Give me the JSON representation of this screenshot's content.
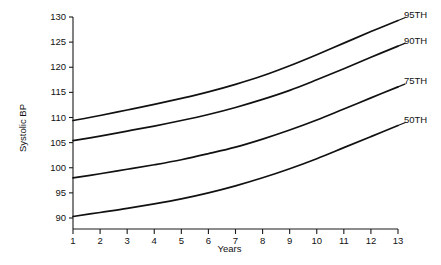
{
  "chart_data": {
    "type": "line",
    "title": "",
    "xlabel": "Years",
    "ylabel": "Systolic BP",
    "xlim": [
      1,
      13
    ],
    "ylim": [
      88,
      130
    ],
    "grid": false,
    "legend_position": "right-of-line-ends",
    "xticks": [
      1,
      2,
      3,
      4,
      5,
      6,
      7,
      8,
      9,
      10,
      11,
      12,
      13
    ],
    "xtick_labels": [
      "1",
      "2",
      "3",
      "4",
      "5",
      "6",
      "7",
      "8",
      "9",
      "10",
      "11",
      "12",
      "13"
    ],
    "yticks": [
      90,
      95,
      100,
      105,
      110,
      115,
      120,
      125,
      130
    ],
    "ytick_labels": [
      "90",
      "95",
      "100",
      "105",
      "110",
      "115",
      "120",
      "125",
      "130"
    ],
    "x": [
      1,
      2,
      3,
      4,
      5,
      6,
      7,
      8,
      9,
      10,
      11,
      12,
      13
    ],
    "series": [
      {
        "name": "95TH",
        "label": "95TH",
        "color": "#111111",
        "values": [
          109.4,
          110.4,
          111.5,
          112.6,
          113.8,
          115.1,
          116.6,
          118.3,
          120.3,
          122.5,
          124.8,
          127.1,
          129.3
        ]
      },
      {
        "name": "90TH",
        "label": "90TH",
        "color": "#111111",
        "values": [
          105.4,
          106.3,
          107.3,
          108.3,
          109.4,
          110.6,
          112.0,
          113.6,
          115.4,
          117.5,
          119.7,
          122.0,
          124.2
        ]
      },
      {
        "name": "75TH",
        "label": "75TH",
        "color": "#111111",
        "values": [
          98.0,
          98.8,
          99.7,
          100.6,
          101.6,
          102.8,
          104.1,
          105.7,
          107.5,
          109.5,
          111.7,
          113.9,
          116.1
        ]
      },
      {
        "name": "50TH",
        "label": "50TH",
        "color": "#111111",
        "values": [
          90.3,
          91.1,
          91.9,
          92.8,
          93.8,
          95.0,
          96.4,
          98.0,
          99.8,
          101.8,
          104.0,
          106.2,
          108.4
        ]
      }
    ]
  },
  "colors": {
    "axis": "#1a1a1a",
    "curve": "#111111",
    "background": "#ffffff"
  }
}
